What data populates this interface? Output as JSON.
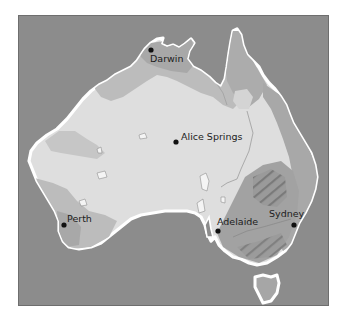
{
  "map": {
    "region": "Australia",
    "colors": {
      "sea": "#8c8c8c",
      "land_arid": "#dedede",
      "land_semi": "#bcbcbc",
      "land_humid": "#a6a6a6",
      "highlands": "#8e8e8e",
      "coastline": "#ffffff",
      "city_dot": "#111111",
      "label": "#1c1c1c",
      "frame_border": "#6e6e6e"
    },
    "cities": [
      {
        "name": "Darwin",
        "dot": {
          "x": 150,
          "y": 49
        },
        "label": {
          "x": 149,
          "y": 61
        }
      },
      {
        "name": "Alice Springs",
        "dot": {
          "x": 175,
          "y": 141
        },
        "label": {
          "x": 180,
          "y": 139
        }
      },
      {
        "name": "Perth",
        "dot": {
          "x": 63,
          "y": 224
        },
        "label": {
          "x": 66,
          "y": 221
        }
      },
      {
        "name": "Adelaide",
        "dot": {
          "x": 217,
          "y": 230
        },
        "label": {
          "x": 216,
          "y": 224
        }
      },
      {
        "name": "Sydney",
        "dot": {
          "x": 293,
          "y": 224
        },
        "label": {
          "x": 268,
          "y": 216
        }
      }
    ]
  }
}
